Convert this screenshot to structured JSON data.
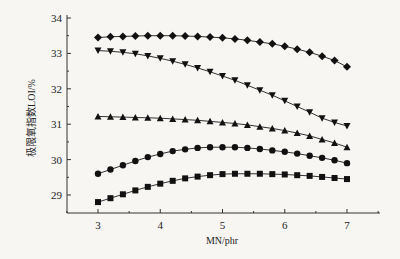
{
  "chart_data": {
    "type": "line",
    "title": "",
    "xlabel": "MN/phr",
    "ylabel": "极限氧指数LOI/%",
    "xlim": [
      2.5,
      7.3
    ],
    "ylim": [
      28.5,
      34
    ],
    "xticks": [
      3,
      4,
      5,
      6,
      7
    ],
    "yticks": [
      29,
      30,
      31,
      32,
      33,
      34
    ],
    "grid": false,
    "legend": "none",
    "x": [
      3.0,
      3.2,
      3.4,
      3.6,
      3.8,
      4.0,
      4.2,
      4.4,
      4.6,
      4.8,
      5.0,
      5.2,
      5.4,
      5.6,
      5.8,
      6.0,
      6.2,
      6.4,
      6.6,
      6.8,
      7.0
    ],
    "series": [
      {
        "name": "diamond",
        "marker": "diamond",
        "values": [
          33.45,
          33.47,
          33.48,
          33.49,
          33.5,
          33.5,
          33.5,
          33.49,
          33.48,
          33.46,
          33.44,
          33.41,
          33.37,
          33.32,
          33.27,
          33.2,
          33.12,
          33.03,
          32.92,
          32.8,
          32.62
        ]
      },
      {
        "name": "triangle-down",
        "marker": "triangle-down",
        "values": [
          33.08,
          33.06,
          33.03,
          32.99,
          32.93,
          32.86,
          32.78,
          32.69,
          32.59,
          32.48,
          32.36,
          32.24,
          32.1,
          31.96,
          31.82,
          31.66,
          31.5,
          31.34,
          31.17,
          31.05,
          30.95
        ]
      },
      {
        "name": "triangle-up",
        "marker": "triangle-up",
        "values": [
          31.22,
          31.21,
          31.2,
          31.19,
          31.18,
          31.17,
          31.15,
          31.13,
          31.11,
          31.08,
          31.05,
          31.02,
          30.98,
          30.93,
          30.88,
          30.82,
          30.75,
          30.67,
          30.57,
          30.47,
          30.35
        ]
      },
      {
        "name": "circle",
        "marker": "circle",
        "values": [
          29.6,
          29.72,
          29.84,
          29.96,
          30.07,
          30.16,
          30.24,
          30.29,
          30.33,
          30.35,
          30.35,
          30.35,
          30.33,
          30.3,
          30.26,
          30.22,
          30.17,
          30.11,
          30.05,
          29.98,
          29.9
        ]
      },
      {
        "name": "square",
        "marker": "square",
        "values": [
          28.8,
          28.91,
          29.02,
          29.13,
          29.23,
          29.32,
          29.4,
          29.47,
          29.52,
          29.56,
          29.59,
          29.6,
          29.6,
          29.6,
          29.59,
          29.58,
          29.56,
          29.54,
          29.51,
          29.48,
          29.45
        ]
      }
    ]
  }
}
